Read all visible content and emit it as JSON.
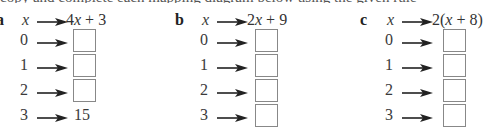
{
  "top_line_cut": "copy and complete each mapping diagram below using the given rule",
  "parts": [
    {
      "letter": "a",
      "variable": "x",
      "rule": "4x + 3",
      "inputs": [
        "0",
        "1",
        "2",
        "3"
      ],
      "outputs": [
        "",
        "",
        "",
        "15"
      ]
    },
    {
      "letter": "b",
      "variable": "x",
      "rule": "2x + 9",
      "inputs": [
        "0",
        "1",
        "2",
        "3"
      ],
      "outputs": [
        "",
        "",
        "",
        ""
      ]
    },
    {
      "letter": "c",
      "variable": "x",
      "rule": "2(x + 8)",
      "inputs": [
        "0",
        "1",
        "2",
        "3"
      ],
      "outputs": [
        "",
        "",
        "",
        ""
      ]
    }
  ]
}
